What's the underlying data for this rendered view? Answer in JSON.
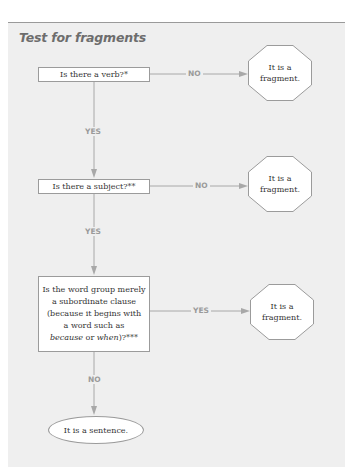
{
  "title": "Test for fragments",
  "colors": {
    "panel_bg": "#efefef",
    "panel_border": "#9a9a9a",
    "title": "#6d6d6d",
    "connector": "#a8a8a8",
    "label": "#9a9a9a",
    "shape_border": "#9b9b9b",
    "shape_fill": "#ffffff"
  },
  "nodes": {
    "q1": {
      "text": "Is there a verb?*"
    },
    "q2": {
      "text": "Is there a subject?**"
    },
    "q3": {
      "line1": "Is the word group merely",
      "line2": "a subordinate clause",
      "line3": "(because it begins with",
      "line4": "a word such as",
      "line5_em1": "because",
      "line5_mid": " or ",
      "line5_em2": "when",
      "line5_end": ")?***"
    },
    "frag1": {
      "line1": "It is a",
      "line2": "fragment."
    },
    "frag2": {
      "line1": "It is a",
      "line2": "fragment."
    },
    "frag3": {
      "line1": "It is a",
      "line2": "fragment."
    },
    "end": {
      "text": "It is a sentence."
    }
  },
  "edges": {
    "q1_to_frag1": "NO",
    "q1_to_q2": "YES",
    "q2_to_frag2": "NO",
    "q2_to_q3": "YES",
    "q3_to_frag3": "YES",
    "q3_to_end": "NO"
  }
}
